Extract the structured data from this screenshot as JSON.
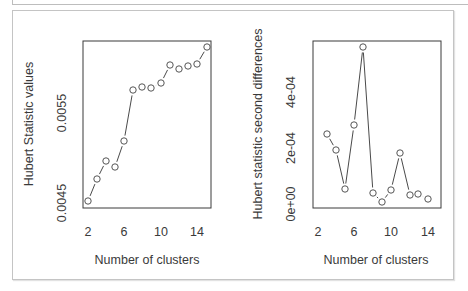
{
  "figure": {
    "colors": {
      "frame": "#3a3a3a",
      "line": "#4a4a4a",
      "point": "#555555",
      "text": "#3a3a3a",
      "outer_border": "#c4c4c4"
    }
  },
  "chart_data": [
    {
      "type": "line",
      "style": "points-and-lines (R type='b')",
      "title": "",
      "xlabel": "Number of clusters",
      "ylabel": "Hubert Statistic values",
      "x_ticks": [
        "2",
        "6",
        "10",
        "14"
      ],
      "y_ticks": [
        "0.0045",
        "0.0055"
      ],
      "xlim": [
        2,
        15
      ],
      "ylim": [
        0.00448,
        0.00632
      ],
      "grid": false,
      "legend": null,
      "x": [
        2,
        3,
        4,
        5,
        6,
        7,
        8,
        9,
        10,
        11,
        12,
        13,
        14,
        15
      ],
      "values": [
        0.00449,
        0.00474,
        0.00494,
        0.00487,
        0.00516,
        0.00573,
        0.00577,
        0.00575,
        0.00581,
        0.00601,
        0.00597,
        0.006,
        0.00602,
        0.00621
      ]
    },
    {
      "type": "line",
      "style": "points-and-lines (R type='b')",
      "title": "",
      "xlabel": "Number of clusters",
      "ylabel": "Hubert statistic second differences",
      "x_ticks": [
        "2",
        "6",
        "10",
        "14"
      ],
      "y_ticks": [
        "0e+00",
        "2e-04",
        "4e-04"
      ],
      "xlim": [
        2,
        15
      ],
      "ylim": [
        -1e-05,
        0.00057
      ],
      "grid": false,
      "legend": null,
      "x": [
        3,
        4,
        5,
        6,
        7,
        8,
        9,
        10,
        11,
        12,
        13,
        14
      ],
      "values": [
        0.00025,
        0.000193,
        5.4e-05,
        0.000282,
        0.000561,
        3.9e-05,
        7e-06,
        5e-05,
        0.000182,
        3.2e-05,
        3.6e-05,
        1.8e-05
      ]
    }
  ],
  "panels": {
    "left": {
      "ylabel": "Hubert Statistic values",
      "xlabel": "Number of clusters",
      "x_ticks": [
        {
          "label": "2",
          "x": 88
        },
        {
          "label": "6",
          "x": 124
        },
        {
          "label": "10",
          "x": 161
        },
        {
          "label": "14",
          "x": 197
        }
      ],
      "y_ticks": [
        {
          "label": "0.0045",
          "y": 203
        },
        {
          "label": "0.0055",
          "y": 113
        }
      ],
      "points": [
        [
          88,
          201
        ],
        [
          97,
          179
        ],
        [
          106,
          161
        ],
        [
          115,
          167
        ],
        [
          124,
          141
        ],
        [
          133,
          90
        ],
        [
          142,
          87
        ],
        [
          151,
          88
        ],
        [
          161,
          83
        ],
        [
          170,
          65
        ],
        [
          179,
          69
        ],
        [
          188,
          66
        ],
        [
          197,
          64
        ],
        [
          207,
          47
        ]
      ]
    },
    "right": {
      "ylabel": "Hubert statistic second differences",
      "xlabel": "Number of clusters",
      "x_ticks": [
        {
          "label": "2",
          "x": 318
        },
        {
          "label": "6",
          "x": 354
        },
        {
          "label": "10",
          "x": 391
        },
        {
          "label": "14",
          "x": 428
        }
      ],
      "y_ticks": [
        {
          "label": "0e+00",
          "y": 204
        },
        {
          "label": "2e-04",
          "y": 148
        },
        {
          "label": "4e-04",
          "y": 92
        }
      ],
      "points": [
        [
          327,
          134
        ],
        [
          336,
          150
        ],
        [
          345,
          189
        ],
        [
          354,
          125
        ],
        [
          363,
          47
        ],
        [
          373,
          193
        ],
        [
          382,
          202
        ],
        [
          391,
          190
        ],
        [
          400,
          153
        ],
        [
          410,
          195
        ],
        [
          418,
          194
        ],
        [
          428,
          199
        ]
      ]
    }
  }
}
